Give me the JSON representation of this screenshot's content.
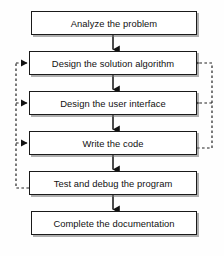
{
  "diagram": {
    "type": "flowchart",
    "background_color": "#fefefe",
    "box_fill": "#ffffff",
    "box_border_color": "#1a1a1a",
    "arrow_color": "#111111",
    "feedback_line_color": "#222222",
    "feedback_line_style": "dashed",
    "steps": [
      {
        "id": "step-1",
        "label": "Analyze the problem",
        "x": 31,
        "y": 11,
        "width": 166,
        "height": 24
      },
      {
        "id": "step-2",
        "label": "Design the solution algorithm",
        "x": 29,
        "y": 51,
        "width": 168,
        "height": 24
      },
      {
        "id": "step-3",
        "label": "Design the user interface",
        "x": 29,
        "y": 91,
        "width": 168,
        "height": 24
      },
      {
        "id": "step-4",
        "label": "Write the code",
        "x": 29,
        "y": 131,
        "width": 168,
        "height": 24
      },
      {
        "id": "step-5",
        "label": "Test and debug the program",
        "x": 29,
        "y": 171,
        "width": 168,
        "height": 24
      },
      {
        "id": "step-6",
        "label": "Complete the documentation",
        "x": 31,
        "y": 211,
        "width": 166,
        "height": 24
      }
    ],
    "flow_arrows": [
      {
        "id": "arrow-1-2",
        "from": "step-1",
        "to": "step-2",
        "x": 113,
        "y1": 35,
        "y2": 51
      },
      {
        "id": "arrow-2-3",
        "from": "step-2",
        "to": "step-3",
        "x": 113,
        "y1": 75,
        "y2": 91
      },
      {
        "id": "arrow-3-4",
        "from": "step-3",
        "to": "step-4",
        "x": 113,
        "y1": 115,
        "y2": 131
      },
      {
        "id": "arrow-4-5",
        "from": "step-4",
        "to": "step-5",
        "x": 113,
        "y1": 155,
        "y2": 171
      },
      {
        "id": "arrow-5-6",
        "from": "step-5",
        "to": "step-6",
        "x": 113,
        "y1": 195,
        "y2": 211
      }
    ],
    "feedback_loops": [
      {
        "id": "feedback-left",
        "source": "step-5",
        "source_label": "Test and debug the program",
        "side": "left",
        "bus_x": 16,
        "targets": [
          "step-2",
          "step-3",
          "step-4"
        ],
        "target_labels": [
          "Design the solution algorithm",
          "Design the user interface",
          "Write the code"
        ]
      },
      {
        "id": "feedback-right",
        "source": "step-4",
        "source_label": "Write the code",
        "side": "right",
        "bus_x": 212,
        "targets": [
          "step-2",
          "step-3"
        ],
        "target_labels": [
          "Design the solution algorithm",
          "Design the user interface"
        ]
      }
    ]
  }
}
